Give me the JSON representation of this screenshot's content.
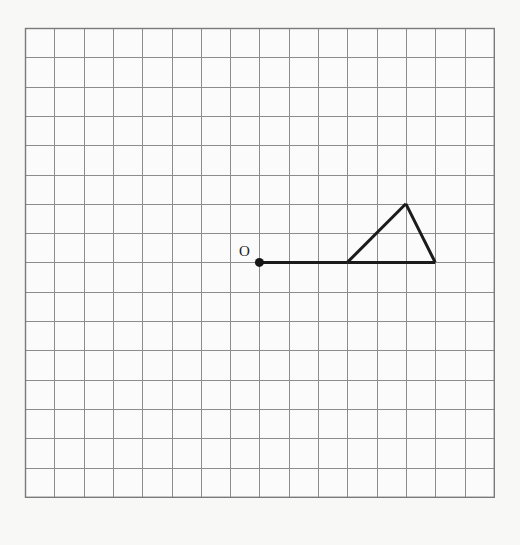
{
  "figure": {
    "background_color": "#f8f8f7",
    "grid": {
      "columns": 16,
      "rows": 16,
      "origin_px": {
        "x": 25,
        "y": 28
      },
      "cell_size_px": 29.3,
      "line_color": "#8c8c8c",
      "border_color": "#7a7a7a",
      "cell_fill": "#fbfbfb",
      "show_grid": true
    },
    "stroke": {
      "color": "#1b1b1b",
      "width_px": 3
    },
    "points": [
      {
        "name": "O",
        "label": "O",
        "grid": {
          "x": 8,
          "y": 8
        },
        "marker": "filled-dot",
        "marker_radius_px": 4.5,
        "label_offset_px": {
          "x": -15,
          "y": -6
        }
      }
    ],
    "segments": [
      {
        "name": "ray-base",
        "from": {
          "x": 8,
          "y": 8
        },
        "to": {
          "x": 11,
          "y": 8
        }
      },
      {
        "name": "triangle-base",
        "from": {
          "x": 11,
          "y": 8
        },
        "to": {
          "x": 14,
          "y": 8
        }
      },
      {
        "name": "triangle-left-side",
        "from": {
          "x": 11,
          "y": 8
        },
        "to": {
          "x": 13,
          "y": 6
        }
      },
      {
        "name": "triangle-right-side",
        "from": {
          "x": 13,
          "y": 6
        },
        "to": {
          "x": 14,
          "y": 8
        }
      }
    ],
    "triangle": {
      "name": "triangle",
      "vertices": [
        {
          "x": 11,
          "y": 8
        },
        {
          "x": 13,
          "y": 6
        },
        {
          "x": 14,
          "y": 8
        }
      ]
    }
  }
}
